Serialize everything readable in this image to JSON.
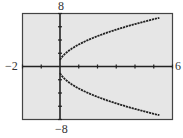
{
  "chart_data": {
    "type": "line",
    "title": "",
    "xlabel": "",
    "ylabel": "",
    "xlim": [
      -2,
      6
    ],
    "ylim": [
      -8,
      8
    ],
    "x_tick_step": 1,
    "y_tick_step": 2,
    "grid": false,
    "window_labels": {
      "xmin": "−2",
      "xmax": "6",
      "ymin": "−8",
      "ymax": "8"
    },
    "series": [
      {
        "name": "upper branch",
        "x": [
          0,
          0.25,
          0.5,
          1,
          1.5,
          2,
          2.5,
          3,
          3.5,
          4,
          4.5,
          5,
          5.3
        ],
        "values": [
          1.0,
          1.87,
          2.45,
          3.32,
          4.0,
          4.58,
          5.1,
          5.57,
          6.0,
          6.4,
          6.78,
          7.14,
          7.35
        ]
      },
      {
        "name": "lower branch",
        "x": [
          0,
          0.25,
          0.5,
          1,
          1.5,
          2,
          2.5,
          3,
          3.5,
          4,
          4.5,
          5,
          5.3
        ],
        "values": [
          -1.0,
          -1.87,
          -2.45,
          -3.32,
          -4.0,
          -4.58,
          -5.1,
          -5.57,
          -6.0,
          -6.4,
          -6.78,
          -7.14,
          -7.35
        ]
      }
    ]
  },
  "colors": {
    "plot_background": "#e6e6e6",
    "axis": "#222222",
    "curve": "#222222",
    "frame": "#444444"
  }
}
